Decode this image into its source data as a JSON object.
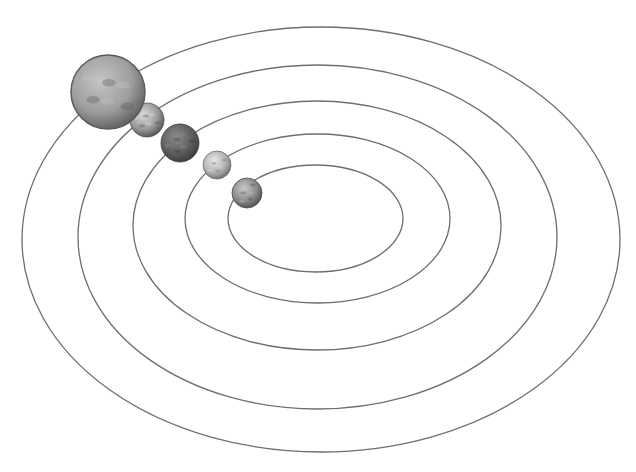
{
  "diagram": {
    "type": "solar-system-orbits",
    "background": "#ffffff",
    "orbit_color": "#6e6e6e",
    "orbits": [
      {
        "id": "orbit-1",
        "cx": 315.5,
        "cy": 218.5,
        "rx": 87.5,
        "ry": 53.5
      },
      {
        "id": "orbit-2",
        "cx": 317.5,
        "cy": 218.5,
        "rx": 132.5,
        "ry": 84.5
      },
      {
        "id": "orbit-3",
        "cx": 317,
        "cy": 225.5,
        "rx": 184,
        "ry": 124.5
      },
      {
        "id": "orbit-4",
        "cx": 317.5,
        "cy": 237,
        "rx": 239.5,
        "ry": 172
      },
      {
        "id": "orbit-5",
        "cx": 321,
        "cy": 239.5,
        "rx": 299,
        "ry": 212.5
      }
    ],
    "planets": [
      {
        "id": "planet-1",
        "cx": 247,
        "cy": 193,
        "r": 15,
        "light": "#c9c9c9",
        "mid": "#8a8a8a",
        "dark": "#4a4a4a"
      },
      {
        "id": "planet-2",
        "cx": 217,
        "cy": 165,
        "r": 14,
        "light": "#e6e6e6",
        "mid": "#b3b3b3",
        "dark": "#6a6a6a"
      },
      {
        "id": "planet-3",
        "cx": 180,
        "cy": 143,
        "r": 19,
        "light": "#8c8c8c",
        "mid": "#5e5e5e",
        "dark": "#3a3a3a"
      },
      {
        "id": "planet-4",
        "cx": 147,
        "cy": 120,
        "r": 17,
        "light": "#dcdcdc",
        "mid": "#9a9a9a",
        "dark": "#4e4e4e"
      },
      {
        "id": "planet-5",
        "cx": 108,
        "cy": 92,
        "r": 37,
        "light": "#c4c4c4",
        "mid": "#9e9e9e",
        "dark": "#5a5a5a"
      }
    ]
  }
}
